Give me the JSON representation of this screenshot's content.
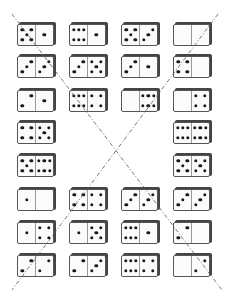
{
  "puzzle": {
    "description": "Domino arrangement with two dashed diagonal lines",
    "line_color": "#555555",
    "dominoes": [
      {
        "row": 0,
        "col": 0,
        "left": 5,
        "right": 1
      },
      {
        "row": 0,
        "col": 1,
        "left": 6,
        "right": 1
      },
      {
        "row": 0,
        "col": 2,
        "left": 5,
        "right": 3
      },
      {
        "row": 0,
        "col": 3,
        "left": 0,
        "right": 0
      },
      {
        "row": 1,
        "col": 0,
        "left": 3,
        "right": 3
      },
      {
        "row": 1,
        "col": 1,
        "left": 3,
        "right": 5
      },
      {
        "row": 1,
        "col": 2,
        "left": 3,
        "right": 1
      },
      {
        "row": 1,
        "col": 3,
        "left": 4,
        "right": 0
      },
      {
        "row": 2,
        "col": 0,
        "left": 2,
        "right": 1
      },
      {
        "row": 2,
        "col": 1,
        "left": 6,
        "right": 4
      },
      {
        "row": 2,
        "col": 2,
        "left": 0,
        "right": 6
      },
      {
        "row": 2,
        "col": 3,
        "left": 0,
        "right": 4
      },
      {
        "row": 3,
        "col": 0,
        "left": 4,
        "right": 5
      },
      {
        "row": 3,
        "col": 3,
        "left": 6,
        "right": 6
      },
      {
        "row": 4,
        "col": 0,
        "left": 5,
        "right": 6
      },
      {
        "row": 4,
        "col": 3,
        "left": 5,
        "right": 5
      },
      {
        "row": 5,
        "col": 0,
        "left": 1,
        "right": 0
      },
      {
        "row": 5,
        "col": 1,
        "left": 4,
        "right": 4
      },
      {
        "row": 5,
        "col": 2,
        "left": 3,
        "right": 3
      },
      {
        "row": 5,
        "col": 3,
        "left": 3,
        "right": 3
      },
      {
        "row": 6,
        "col": 0,
        "left": 1,
        "right": 4
      },
      {
        "row": 6,
        "col": 1,
        "left": 1,
        "right": 5
      },
      {
        "row": 6,
        "col": 2,
        "left": 6,
        "right": 1
      },
      {
        "row": 6,
        "col": 3,
        "left": 2,
        "right": 0
      },
      {
        "row": 7,
        "col": 0,
        "left": 2,
        "right": 2
      },
      {
        "row": 7,
        "col": 1,
        "left": 2,
        "right": 3
      },
      {
        "row": 7,
        "col": 2,
        "left": 6,
        "right": 4
      },
      {
        "row": 7,
        "col": 3,
        "left": 0,
        "right": 2
      }
    ]
  }
}
